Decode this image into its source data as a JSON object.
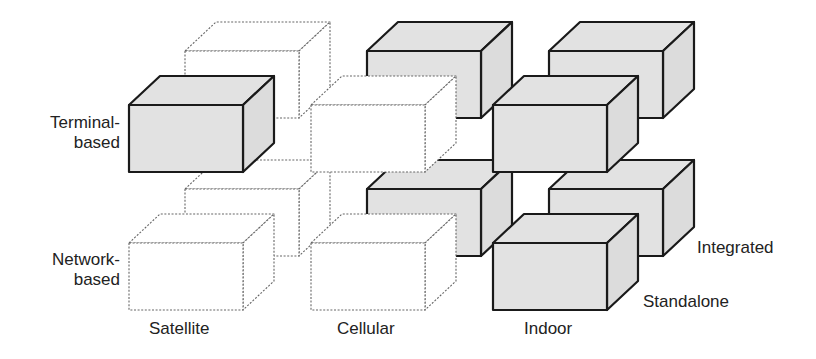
{
  "axes": {
    "x": {
      "labels": [
        "Satellite",
        "Cellular",
        "Indoor"
      ]
    },
    "y": {
      "labels": [
        "Terminal-based",
        "Network-based"
      ]
    },
    "z": {
      "labels": [
        "Standalone",
        "Integrated"
      ]
    }
  },
  "labels": {
    "terminal_line1": "Terminal-",
    "terminal_line2": "based",
    "network_line1": "Network-",
    "network_line2": "based",
    "satellite": "Satellite",
    "cellular": "Cellular",
    "indoor": "Indoor",
    "integrated": "Integrated",
    "standalone": "Standalone"
  },
  "colors": {
    "shaded_fill": "#e2e2e2",
    "shaded_side": "#dcdcdc",
    "stroke": "#1a1a1a",
    "dotted_stroke": "#666666",
    "empty_fill": "#ffffff"
  },
  "cubes": [
    {
      "column": "Satellite",
      "row": "Terminal-based",
      "depth": "Integrated",
      "shaded": false
    },
    {
      "column": "Cellular",
      "row": "Terminal-based",
      "depth": "Integrated",
      "shaded": true
    },
    {
      "column": "Indoor",
      "row": "Terminal-based",
      "depth": "Integrated",
      "shaded": true
    },
    {
      "column": "Satellite",
      "row": "Network-based",
      "depth": "Integrated",
      "shaded": false
    },
    {
      "column": "Cellular",
      "row": "Network-based",
      "depth": "Integrated",
      "shaded": true
    },
    {
      "column": "Indoor",
      "row": "Network-based",
      "depth": "Integrated",
      "shaded": true
    },
    {
      "column": "Satellite",
      "row": "Terminal-based",
      "depth": "Standalone",
      "shaded": true
    },
    {
      "column": "Cellular",
      "row": "Terminal-based",
      "depth": "Standalone",
      "shaded": false
    },
    {
      "column": "Indoor",
      "row": "Terminal-based",
      "depth": "Standalone",
      "shaded": true
    },
    {
      "column": "Satellite",
      "row": "Network-based",
      "depth": "Standalone",
      "shaded": false
    },
    {
      "column": "Cellular",
      "row": "Network-based",
      "depth": "Standalone",
      "shaded": false
    },
    {
      "column": "Indoor",
      "row": "Network-based",
      "depth": "Standalone",
      "shaded": true
    }
  ]
}
